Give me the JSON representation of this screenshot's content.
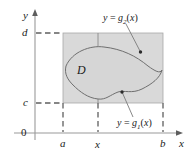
{
  "figure": {
    "colors": {
      "background": "#ffffff",
      "shaded_region": "#d9d9d9",
      "shaded_border": "#a0a0a0",
      "curve": "#6b6b6b",
      "axis": "#9a9a9a",
      "dash": "#6b6b6b",
      "text": "#1a1a1a",
      "leader": "#7a7a7a"
    },
    "axes": {
      "y_axis_label": "y",
      "x_axis_label": "x",
      "origin_label": "0"
    },
    "ticks": {
      "x": [
        {
          "name": "a-tick-label",
          "label": "a",
          "px": 63
        },
        {
          "name": "x-tick-label",
          "label": "x",
          "px": 98
        },
        {
          "name": "b-tick-label",
          "label": "b",
          "px": 163
        }
      ],
      "y": [
        {
          "name": "c-tick-label",
          "label": "c",
          "px": 103
        },
        {
          "name": "d-tick-label",
          "label": "d",
          "px": 33
        }
      ]
    },
    "region": {
      "label": "D"
    },
    "curves": [
      {
        "name": "upper-boundary",
        "label_html": "<i>y</i> = <i>g</i><sub>2</sub>(<i>x</i>)",
        "label_text": "y = g2(x)"
      },
      {
        "name": "lower-boundary",
        "label_html": "<i>y</i> = <i>g</i><sub>1</sub>(<i>x</i>)",
        "label_text": "y = g1(x)"
      }
    ]
  }
}
